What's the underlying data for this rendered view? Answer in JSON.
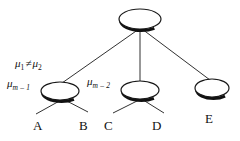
{
  "diagram": {
    "type": "tree-diagram",
    "background_color": "#ffffff",
    "stroke_color": "#1a1a1a",
    "node_fill": "#ffffff",
    "nodes": [
      {
        "id": "root",
        "shape": "ellipse",
        "cx": 140,
        "cy": 19,
        "rx": 21,
        "ry": 10,
        "label": ""
      },
      {
        "id": "left",
        "shape": "ellipse",
        "cx": 60,
        "cy": 91,
        "rx": 19,
        "ry": 9,
        "label": ""
      },
      {
        "id": "mid",
        "shape": "ellipse",
        "cx": 140,
        "cy": 90,
        "rx": 19,
        "ry": 9,
        "label": ""
      },
      {
        "id": "right",
        "shape": "ellipse",
        "cx": 212,
        "cy": 88,
        "rx": 17,
        "ry": 9,
        "label": ""
      }
    ],
    "annotations": {
      "mu_inequality": {
        "mu": "μ",
        "sub1": "1",
        "operator": "≠",
        "sub2": "2"
      },
      "mu_m_minus_1": {
        "mu": "μ",
        "sub": "m – 1"
      },
      "mu_m_minus_2": {
        "mu": "μ",
        "sub": "m – 2"
      }
    },
    "leaf_labels": {
      "a": "A",
      "b": "B",
      "c": "C",
      "d": "D",
      "e": "E"
    }
  }
}
